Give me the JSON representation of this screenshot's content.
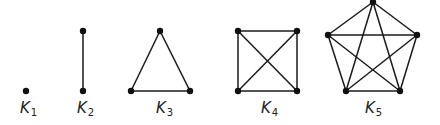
{
  "colors": {
    "edge": "#1a1a1a",
    "node": "#111111",
    "label": "#222222",
    "background": "#ffffff"
  },
  "graphs": [
    {
      "id": "K1",
      "label_main": "K",
      "label_sub": "1",
      "label_pos": [
        20,
        113
      ],
      "nodes": [
        [
          26,
          91
        ]
      ],
      "edges": []
    },
    {
      "id": "K2",
      "label_main": "K",
      "label_sub": "2",
      "label_pos": [
        77,
        113
      ],
      "nodes": [
        [
          83,
          31
        ],
        [
          83,
          91
        ]
      ],
      "edges": [
        [
          0,
          1
        ]
      ]
    },
    {
      "id": "K3",
      "label_main": "K",
      "label_sub": "3",
      "label_pos": [
        156,
        113
      ],
      "nodes": [
        [
          160,
          31
        ],
        [
          131,
          91
        ],
        [
          190,
          91
        ]
      ],
      "edges": [
        [
          0,
          1
        ],
        [
          0,
          2
        ],
        [
          1,
          2
        ]
      ]
    },
    {
      "id": "K4",
      "label_main": "K",
      "label_sub": "4",
      "label_pos": [
        261,
        113
      ],
      "nodes": [
        [
          238,
          31
        ],
        [
          297,
          31
        ],
        [
          238,
          91
        ],
        [
          297,
          91
        ]
      ],
      "edges": [
        [
          0,
          1
        ],
        [
          0,
          2
        ],
        [
          0,
          3
        ],
        [
          1,
          2
        ],
        [
          1,
          3
        ],
        [
          2,
          3
        ]
      ]
    },
    {
      "id": "K5",
      "label_main": "K",
      "label_sub": "5",
      "label_pos": [
        365,
        113
      ],
      "nodes": [
        [
          373,
          2
        ],
        [
          328,
          35
        ],
        [
          417,
          35
        ],
        [
          346,
          91
        ],
        [
          400,
          91
        ]
      ],
      "edges": [
        [
          0,
          1
        ],
        [
          0,
          2
        ],
        [
          0,
          3
        ],
        [
          0,
          4
        ],
        [
          1,
          2
        ],
        [
          1,
          3
        ],
        [
          1,
          4
        ],
        [
          2,
          3
        ],
        [
          2,
          4
        ],
        [
          3,
          4
        ]
      ]
    }
  ]
}
